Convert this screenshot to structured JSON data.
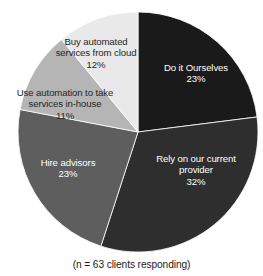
{
  "title_remnant": "",
  "caption": "(n = 63 clients responding)",
  "chart_data": {
    "type": "pie",
    "title": "",
    "xlabel": "",
    "ylabel": "",
    "legend": "none",
    "grid": false,
    "note": "(n = 63 clients responding)",
    "sample_size": 63,
    "start_angle_deg": 0,
    "direction": "clockwise",
    "categories": [
      "Do it Ourselves",
      "Rely on our current provider",
      "Hire advisors",
      "Use automation to take services in-house",
      "Buy automated services from cloud"
    ],
    "values": [
      23,
      32,
      23,
      11,
      12
    ],
    "value_labels": [
      "23%",
      "32%",
      "23%",
      "11%",
      "12%"
    ],
    "unit": "%",
    "colors": [
      "#1a1a1a",
      "#2e2e2e",
      "#5e5e5e",
      "#b5b5b5",
      "#e9e9e9"
    ],
    "slices": [
      {
        "label": "Do it Ourselves",
        "value": 23,
        "value_label": "23%",
        "color": "#1a1a1a",
        "label_color": "#ffffff",
        "start_deg": 0,
        "end_deg": 82.8
      },
      {
        "label": "Rely on our current provider",
        "value": 32,
        "value_label": "32%",
        "color": "#2e2e2e",
        "label_color": "#ffffff",
        "start_deg": 82.8,
        "end_deg": 198.0
      },
      {
        "label": "Hire advisors",
        "value": 23,
        "value_label": "23%",
        "color": "#5e5e5e",
        "label_color": "#ffffff",
        "start_deg": 198.0,
        "end_deg": 280.8
      },
      {
        "label": "Use automation to take services in-house",
        "value": 11,
        "value_label": "11%",
        "color": "#b5b5b5",
        "label_color": "#262626",
        "start_deg": 280.8,
        "end_deg": 320.4
      },
      {
        "label": "Buy automated services from cloud",
        "value": 12,
        "value_label": "12%",
        "color": "#e9e9e9",
        "label_color": "#262626",
        "start_deg": 320.4,
        "end_deg": 360.0
      }
    ]
  },
  "labels": {
    "do_it_ourselves": {
      "text": "Do it Ourselves",
      "pct": "23%"
    },
    "rely_provider": {
      "text": "Rely on our current provider",
      "pct": "32%"
    },
    "hire_advisors": {
      "text": "Hire advisors",
      "pct": "23%"
    },
    "in_house": {
      "text": "Use automation to take services in-house",
      "pct": "11%"
    },
    "cloud": {
      "text": "Buy automated services from cloud",
      "pct": "12%"
    }
  }
}
